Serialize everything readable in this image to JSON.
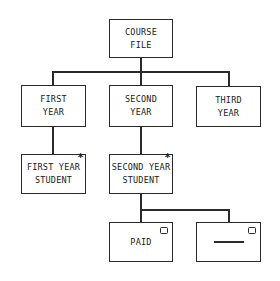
{
  "diagram": {
    "type": "jackson-structure-diagram",
    "root": {
      "label": "COURSE\nFILE"
    },
    "level1": [
      {
        "label": "FIRST\nYEAR"
      },
      {
        "label": "SECOND\nYEAR"
      },
      {
        "label": "THIRD\nYEAR"
      }
    ],
    "level2": [
      {
        "label": "FIRST YEAR\nSTUDENT",
        "marker": "*",
        "marker_meaning": "iteration"
      },
      {
        "label": "SECOND YEAR\nSTUDENT",
        "marker": "*",
        "marker_meaning": "iteration"
      }
    ],
    "level3": [
      {
        "label": "PAID",
        "marker": "o",
        "marker_meaning": "selection"
      },
      {
        "label": "",
        "marker": "o",
        "marker_meaning": "selection",
        "content": "dash"
      }
    ]
  },
  "colors": {
    "stroke": "#2a2a2a",
    "background": "#ffffff",
    "text": "#1a1a1a"
  }
}
